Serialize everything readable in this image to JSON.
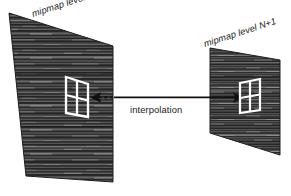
{
  "figure": {
    "title_text": "",
    "background_color": "#ffffff",
    "width": 291,
    "height": 196
  },
  "labels": {
    "left_plane": "mipmap level N",
    "right_plane": "mipmap level N+1",
    "arrow": "interpolation"
  },
  "colors": {
    "ink": "#1a1a1a",
    "frame_stroke": "#ffffff",
    "texture_dark": "#2b2b2b",
    "texture_mid": "#4a4a4a",
    "texture_light": "#7d7d7d",
    "plane_border": "#1d1d1d",
    "arrow": "#101010",
    "page_background": "#ffffff"
  },
  "planes": [
    {
      "name": "mipmap-level-n-plane",
      "label": "mipmap level N",
      "points": "9,13 113,46 113,182 26,176",
      "size_class": "large"
    },
    {
      "name": "mipmap-level-n-plus-1-plane",
      "label": "mipmap level N+1",
      "points": "210,48 280,60 280,155 210,133",
      "size_class": "small"
    }
  ],
  "texel_frames": [
    {
      "name": "texel-frame-left",
      "outline": "66,77 88,84 88,117 66,113",
      "mid_vertical": "77,80.5 77,115",
      "mid_horizontal": "66,95 88,100.5",
      "grid": "2x2"
    },
    {
      "name": "texel-frame-right",
      "outline": "240,83 260,79 260,110 240,113",
      "mid_vertical": "250,81 250,111.5",
      "mid_horizontal": "240,98 260,94.5",
      "grid": "2x2"
    }
  ],
  "connectors": [
    {
      "name": "interpolation-arrow-solid",
      "style": "solid",
      "from_x": 113,
      "to_x": 245,
      "y": 97,
      "arrowhead": "right",
      "label": "interpolation"
    },
    {
      "name": "interpolation-arrow-dashed",
      "style": "dashed",
      "from_x": 113,
      "to_x": 88,
      "y": 97,
      "arrowhead": "left",
      "label": ""
    }
  ],
  "annotations": {
    "left_label_rotation_deg": -18,
    "right_label_rotation_deg": -18,
    "arrow_label_x": 158,
    "arrow_label_y": 112
  },
  "diagram_meta": {
    "type": "trilinear-mipmap-interpolation",
    "description": "Two textured mipmap level planes in perspective, each containing a white 2x2 texel frame, linked by a horizontal interpolation arrow."
  }
}
